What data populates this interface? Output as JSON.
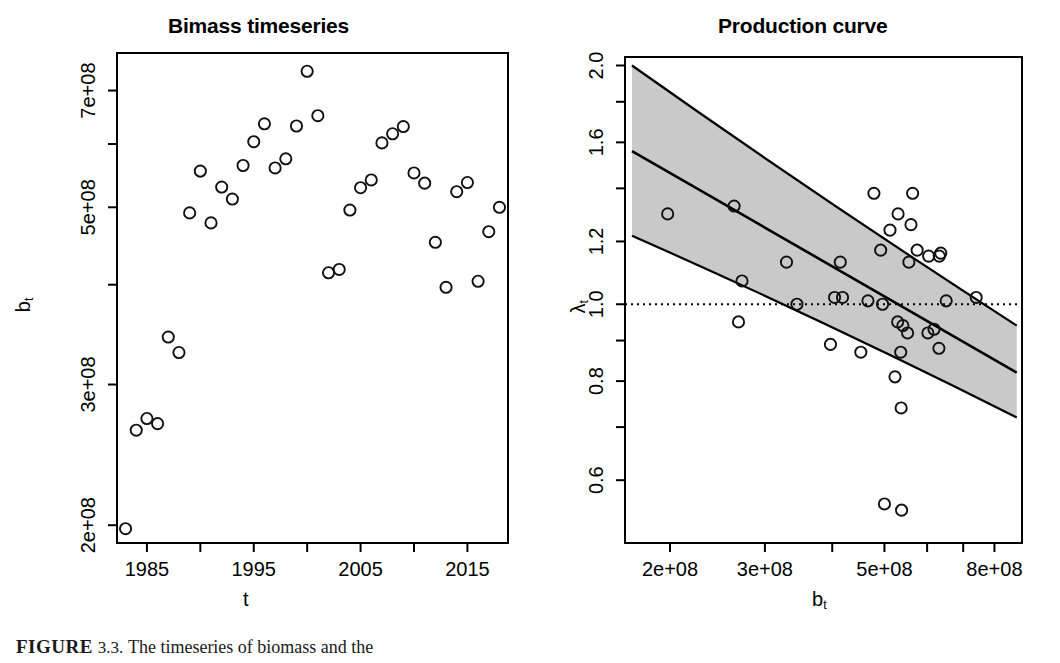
{
  "figure": {
    "caption_head": "FIGURE",
    "caption_number": "3.3.",
    "caption_body": "The timeseries of biomass and the"
  },
  "panels": [
    {
      "id": "biomass-timeseries",
      "title": "Bimass timeseries",
      "xlabel": "t",
      "ylabel": "b",
      "ylabel_sub": "t"
    },
    {
      "id": "production-curve",
      "title": "Production curve",
      "xlabel": "b",
      "xlabel_sub": "t",
      "ylabel": "λ",
      "ylabel_sub": "t"
    }
  ],
  "colors": {
    "foreground": "#000000",
    "background": "#ffffff",
    "band_fill": "#c9c9c9",
    "band_edge": "#000000",
    "point_stroke": "#1a1a1a"
  },
  "chart_data": [
    {
      "type": "scatter",
      "title": "Bimass timeseries",
      "xlabel": "t",
      "ylabel": "b_t",
      "grid": false,
      "legend": null,
      "xscale": "linear",
      "yscale": "log",
      "xlim": [
        1982.2,
        2018.8
      ],
      "ylim": [
        190000000,
        780000000
      ],
      "xticks": [
        1985,
        1990,
        1995,
        2000,
        2005,
        2010,
        2015
      ],
      "xtick_labels": [
        "1985",
        "",
        "1995",
        "",
        "2005",
        "",
        "2015"
      ],
      "yticks": [
        200000000,
        300000000,
        500000000,
        700000000
      ],
      "ytick_labels": [
        "2e+08",
        "3e+08",
        "5e+08",
        "7e+08"
      ],
      "ytick_minor": [
        400000000,
        600000000
      ],
      "marker": "open-circle",
      "x": [
        1983,
        1984,
        1985,
        1986,
        1987,
        1988,
        1989,
        1990,
        1991,
        1992,
        1993,
        1994,
        1995,
        1996,
        1997,
        1998,
        1999,
        2000,
        2001,
        2002,
        2003,
        2004,
        2005,
        2006,
        2007,
        2008,
        2009,
        2010,
        2011,
        2012,
        2013,
        2014,
        2015,
        2016,
        2017,
        2018
      ],
      "y": [
        198000000,
        263000000,
        272000000,
        268000000,
        344000000,
        329000000,
        492000000,
        555000000,
        478000000,
        530000000,
        512000000,
        564000000,
        604000000,
        636000000,
        560000000,
        575000000,
        632000000,
        740000000,
        651000000,
        414000000,
        418000000,
        496000000,
        529000000,
        541000000,
        602000000,
        618000000,
        631000000,
        552000000,
        536000000,
        452000000,
        397000000,
        523000000,
        537000000,
        404000000,
        466000000,
        500000000,
        538000000,
        653000000
      ]
    },
    {
      "type": "scatter",
      "title": "Production curve",
      "xlabel": "b_t",
      "ylabel": "lambda_t",
      "grid": false,
      "legend": null,
      "xscale": "log",
      "yscale": "log",
      "xlim": [
        165000000,
        900000000
      ],
      "ylim": [
        0.5,
        2.05
      ],
      "xticks": [
        200000000,
        300000000,
        400000000,
        500000000,
        600000000,
        700000000,
        800000000
      ],
      "xtick_labels": [
        "2e+08",
        "3e+08",
        "",
        "5e+08",
        "",
        "",
        "8e+08"
      ],
      "yticks": [
        0.6,
        0.8,
        1.0,
        1.2,
        1.6,
        2.0
      ],
      "ytick_labels": [
        "0.6",
        "0.8",
        "1.0",
        "1.2",
        "1.6",
        "2.0"
      ],
      "ytick_minor": [
        0.7,
        0.9,
        1.4,
        1.8
      ],
      "marker": "open-circle",
      "reference_line": {
        "y": 1.0,
        "style": "dotted"
      },
      "fit_line": {
        "label": "fitted production curve",
        "x": [
          170000000,
          880000000
        ],
        "y": [
          1.56,
          0.82
        ],
        "style": "solid"
      },
      "confidence_band": {
        "label": "confidence interval",
        "fill": "#c9c9c9",
        "x": [
          170000000,
          880000000
        ],
        "upper": [
          2.0,
          0.94
        ],
        "lower": [
          1.22,
          0.72
        ]
      },
      "x": [
        198000000,
        263000000,
        272000000,
        268000000,
        344000000,
        329000000,
        492000000,
        555000000,
        478000000,
        530000000,
        512000000,
        564000000,
        604000000,
        636000000,
        560000000,
        575000000,
        632000000,
        740000000,
        651000000,
        414000000,
        418000000,
        496000000,
        529000000,
        541000000,
        602000000,
        618000000,
        631000000,
        552000000,
        536000000,
        452000000,
        397000000,
        523000000,
        537000000,
        404000000,
        466000000,
        500000000,
        538000000
      ],
      "y": [
        1.3,
        1.33,
        1.07,
        0.95,
        1.0,
        1.13,
        1.17,
        1.13,
        1.38,
        1.3,
        1.24,
        1.38,
        1.15,
        1.16,
        1.26,
        1.17,
        1.15,
        1.02,
        1.01,
        1.13,
        1.02,
        1.0,
        0.95,
        0.94,
        0.92,
        0.93,
        0.88,
        0.92,
        0.87,
        0.87,
        0.89,
        0.81,
        0.74,
        1.02,
        1.01,
        0.56,
        0.55
      ]
    }
  ]
}
